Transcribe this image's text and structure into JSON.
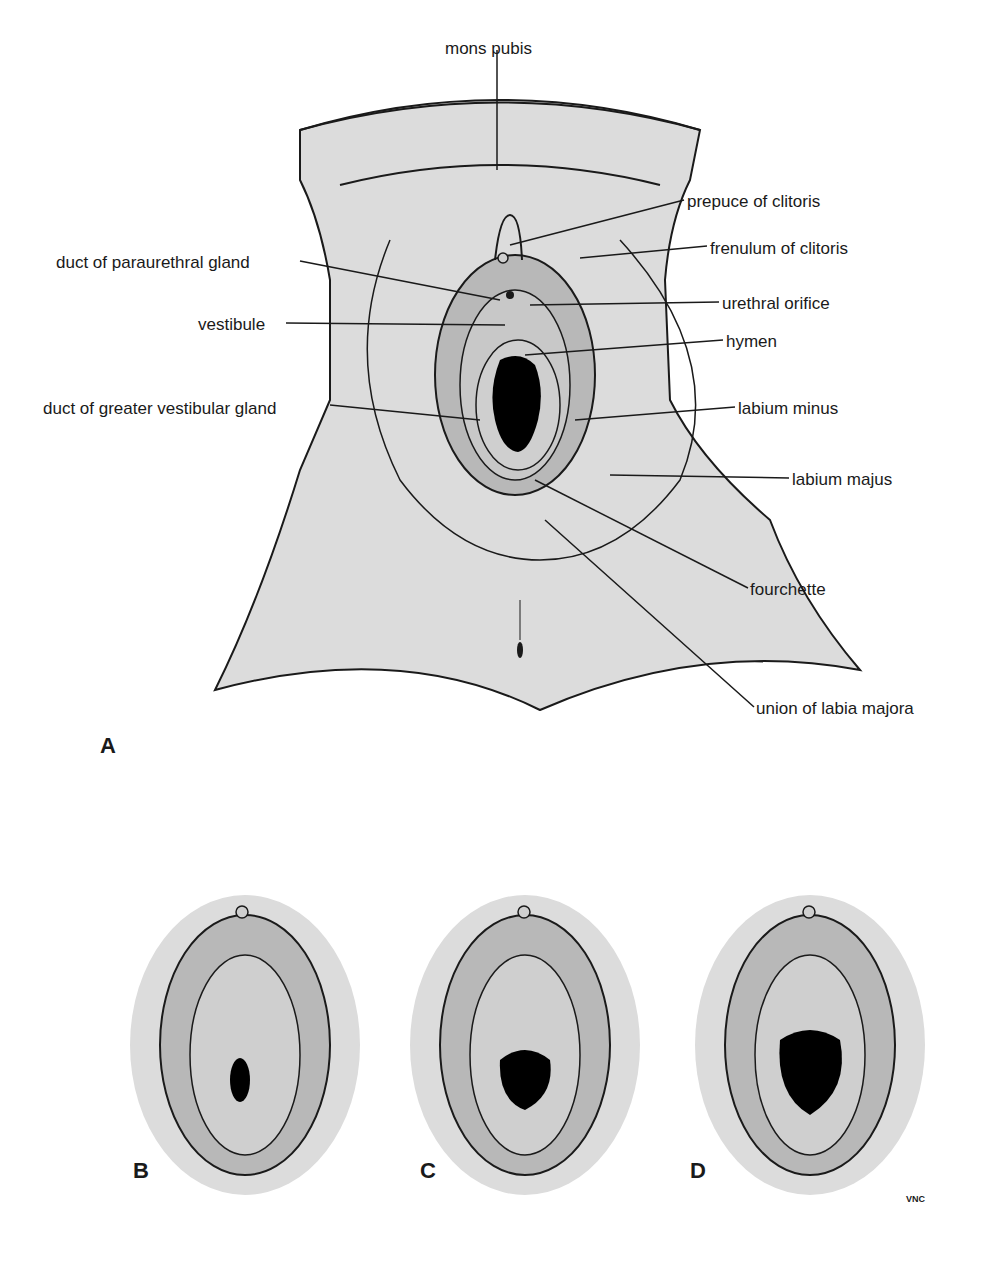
{
  "figure": {
    "panels": [
      "A",
      "B",
      "C",
      "D"
    ],
    "signature": "VNC"
  },
  "labels": [
    {
      "text": "mons pubis",
      "x": 445,
      "y": 40
    },
    {
      "text": "prepuce of clitoris",
      "x": 687,
      "y": 193
    },
    {
      "text": "frenulum of clitoris",
      "x": 710,
      "y": 240
    },
    {
      "text": "duct of paraurethral gland",
      "x": 56,
      "y": 254
    },
    {
      "text": "urethral orifice",
      "x": 722,
      "y": 295
    },
    {
      "text": "vestibule",
      "x": 198,
      "y": 316
    },
    {
      "text": "hymen",
      "x": 726,
      "y": 333
    },
    {
      "text": "duct of greater vestibular gland",
      "x": 43,
      "y": 400
    },
    {
      "text": "labium minus",
      "x": 738,
      "y": 400
    },
    {
      "text": "labium majus",
      "x": 792,
      "y": 471
    },
    {
      "text": "fourchette",
      "x": 750,
      "y": 581
    },
    {
      "text": "union of labia majora",
      "x": 756,
      "y": 700
    }
  ],
  "colors": {
    "skin": "#dcdcdc",
    "inner": "#b8b8b8",
    "outline": "#1a1a1a",
    "opening": "#000000"
  }
}
